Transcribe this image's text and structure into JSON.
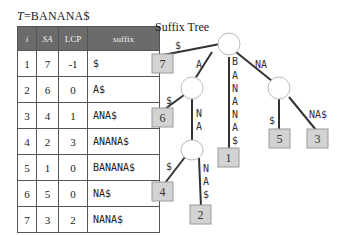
{
  "table": {
    "title_var": "T",
    "title_value": "=BANANA$",
    "headers": [
      "i",
      "SA",
      "LCP",
      "suffix"
    ],
    "rows": [
      {
        "i": "1",
        "sa": "7",
        "lcp": "-1",
        "suffix": "$"
      },
      {
        "i": "2",
        "sa": "6",
        "lcp": "0",
        "suffix": "A$"
      },
      {
        "i": "3",
        "sa": "4",
        "lcp": "1",
        "suffix": "ANA$"
      },
      {
        "i": "4",
        "sa": "2",
        "lcp": "3",
        "suffix": "ANANA$"
      },
      {
        "i": "5",
        "sa": "1",
        "lcp": "0",
        "suffix": "BANANA$"
      },
      {
        "i": "6",
        "sa": "5",
        "lcp": "0",
        "suffix": "NA$"
      },
      {
        "i": "7",
        "sa": "3",
        "lcp": "2",
        "suffix": "NANA$"
      }
    ]
  },
  "tree": {
    "title": "Suffix Tree",
    "edges": {
      "root_leaf7": "$",
      "root_nodeA": "A",
      "root_leaf1": [
        "B",
        "A",
        "N",
        "A",
        "N",
        "A",
        "$"
      ],
      "root_nodeNA": "NA",
      "nodeA_leaf6": "$",
      "nodeA_nodeANA": [
        "N",
        "A"
      ],
      "nodeANA_leaf4": "$",
      "nodeANA_leaf2": [
        "N",
        "A",
        "$"
      ],
      "nodeNA_leaf5": "$",
      "nodeNA_leaf3": "NA$"
    },
    "leaves": {
      "leaf7": "7",
      "leaf6": "6",
      "leaf1": "1",
      "leaf4": "4",
      "leaf2": "2",
      "leaf5": "5",
      "leaf3": "3"
    },
    "colors": {
      "leaf_fill": "#d3d3d3",
      "leaf_border": "#9a9a9a",
      "node_fill": "#ffffff",
      "edge": "#333333",
      "header_bg": "#6b6b6b"
    }
  }
}
